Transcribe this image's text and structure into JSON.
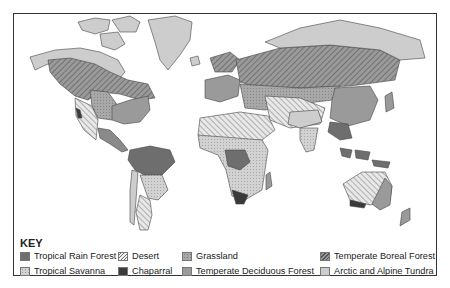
{
  "map": {
    "type": "world biome map"
  },
  "key": {
    "title": "KEY",
    "items": [
      {
        "label": "Tropical Rain Forest",
        "pattern": "solid",
        "color": "#6e6e6e"
      },
      {
        "label": "Desert",
        "pattern": "diagonal-hatch-light",
        "color": "#e2e2e2"
      },
      {
        "label": "Grassland",
        "pattern": "dotted",
        "color": "#a8a8a8"
      },
      {
        "label": "Temperate Boreal Forest",
        "pattern": "diagonal-hatch-dark",
        "color": "#8f8f8f"
      },
      {
        "label": "Tropical Savanna",
        "pattern": "dotted-light",
        "color": "#cfcfcf"
      },
      {
        "label": "Chaparral",
        "pattern": "solid",
        "color": "#3a3a3a"
      },
      {
        "label": "Temperate Deciduous Forest",
        "pattern": "solid",
        "color": "#9a9a9a"
      },
      {
        "label": "Arctic and Alpine Tundra",
        "pattern": "solid",
        "color": "#cdcdcd"
      }
    ]
  }
}
